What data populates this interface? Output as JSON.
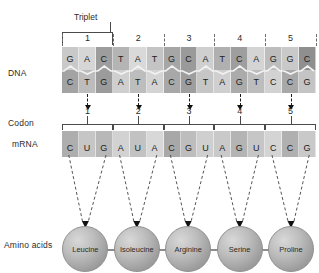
{
  "figure": {
    "triplet_label": "Triplet"
  },
  "row_labels": {
    "dna": "DNA",
    "codon": "Codon",
    "mrna": "mRNA",
    "amino_acids": "Amino acids"
  },
  "numbering": {
    "triplets": [
      "1",
      "2",
      "3",
      "4",
      "5"
    ],
    "codons": [
      "1",
      "2",
      "3",
      "4",
      "5"
    ]
  },
  "dna": {
    "coding_strand": [
      "G",
      "A",
      "C",
      "T",
      "A",
      "T",
      "G",
      "C",
      "A",
      "T",
      "C",
      "A",
      "G",
      "G",
      "C"
    ],
    "template_strand": [
      "C",
      "T",
      "G",
      "A",
      "T",
      "A",
      "C",
      "G",
      "T",
      "A",
      "G",
      "T",
      "C",
      "C",
      "G"
    ],
    "shades_top": [
      "#c9c9c9",
      "#d6d6d6",
      "#9d9d9d",
      "#b4b4b4",
      "#d9d9d9",
      "#c4c4c4",
      "#a6a6a6",
      "#9a9a9a",
      "#cfcfcf",
      "#b0b0b0",
      "#9e9e9e",
      "#d4d4d4",
      "#bdbdbd",
      "#c9c9c9",
      "#8f8f8f"
    ],
    "shades_bottom": [
      "#a3a3a3",
      "#bcbcbc",
      "#9b9b9b",
      "#cfcfcf",
      "#bdbdbd",
      "#d4d4d4",
      "#a8a8a8",
      "#9e9e9e",
      "#c6c6c6",
      "#cfcfcf",
      "#ababab",
      "#bdbdbd",
      "#d2d2d2",
      "#a8a8a8",
      "#c4c4c4"
    ]
  },
  "mrna": {
    "bases": [
      "C",
      "U",
      "G",
      "A",
      "U",
      "A",
      "C",
      "G",
      "U",
      "A",
      "G",
      "U",
      "C",
      "C",
      "G"
    ],
    "shades": [
      "#aeaeae",
      "#c6c6c6",
      "#b8b8b8",
      "#d2d2d2",
      "#c2c2c2",
      "#d8d8d8",
      "#a8a8a8",
      "#bdbdbd",
      "#cfcfcf",
      "#c9c9c9",
      "#b4b4b4",
      "#c6c6c6",
      "#d4d4d4",
      "#b0b0b0",
      "#c9c9c9"
    ]
  },
  "amino_acids": [
    {
      "name": "Leucine"
    },
    {
      "name": "Isoleucine"
    },
    {
      "name": "Arginine"
    },
    {
      "name": "Serine"
    },
    {
      "name": "Proline"
    }
  ],
  "colors": {
    "background": "#ffffff",
    "text": "#2b2b2b",
    "line": "#4a4a4a",
    "arrow": "#111111",
    "sphere": "#bdbdbd"
  }
}
